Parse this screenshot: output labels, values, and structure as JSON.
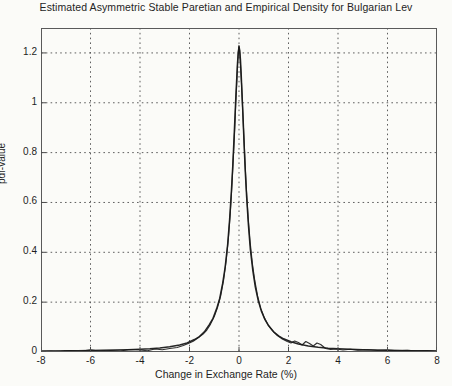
{
  "chart_data": {
    "type": "line",
    "title": "Estimated Asymmetric Stable Paretian and Empirical Density for Bulgarian Lev",
    "xlabel": "Change in Exchange Rate (%)",
    "ylabel": "pdf-value",
    "xlim": [
      -8,
      8
    ],
    "ylim": [
      0,
      1.3
    ],
    "xticks": [
      -8,
      -6,
      -4,
      -2,
      0,
      2,
      4,
      6,
      8
    ],
    "xtick_labels": [
      "-8",
      "-6",
      "-4",
      "-2",
      "0",
      "2",
      "4",
      "6",
      "8"
    ],
    "yticks": [
      0,
      0.2,
      0.4,
      0.6,
      0.8,
      1,
      1.2
    ],
    "ytick_labels": [
      "0",
      "0.2",
      "0.4",
      "0.6",
      "0.8",
      "1",
      "1.2"
    ],
    "grid": true,
    "grid_style": "dotted",
    "legend": null,
    "legend_position": "none",
    "line_color": "#1a1a1a",
    "background_color": "#fbfbf8",
    "axis_color": "#555555",
    "series": [
      {
        "name": "Estimated Asymmetric Stable Paretian Density",
        "style": "solid",
        "x": [
          -8,
          -7.5,
          -7,
          -6.5,
          -6,
          -5.5,
          -5,
          -4.5,
          -4,
          -3.6,
          -3.2,
          -2.8,
          -2.4,
          -2.1,
          -1.8,
          -1.6,
          -1.4,
          -1.2,
          -1.05,
          -0.9,
          -0.78,
          -0.66,
          -0.56,
          -0.46,
          -0.38,
          -0.31,
          -0.25,
          -0.2,
          -0.16,
          -0.12,
          -0.09,
          -0.06,
          -0.03,
          0,
          0.03,
          0.06,
          0.09,
          0.12,
          0.16,
          0.2,
          0.25,
          0.31,
          0.38,
          0.46,
          0.56,
          0.66,
          0.78,
          0.9,
          1.05,
          1.2,
          1.4,
          1.6,
          1.8,
          2.1,
          2.4,
          2.8,
          3.2,
          3.6,
          4,
          4.5,
          5,
          5.5,
          6,
          6.5,
          7,
          7.5,
          8
        ],
        "y": [
          0.004,
          0.004,
          0.005,
          0.005,
          0.006,
          0.007,
          0.008,
          0.009,
          0.011,
          0.013,
          0.016,
          0.021,
          0.028,
          0.036,
          0.05,
          0.062,
          0.081,
          0.11,
          0.135,
          0.175,
          0.215,
          0.275,
          0.34,
          0.43,
          0.53,
          0.64,
          0.75,
          0.86,
          0.95,
          1.04,
          1.1,
          1.16,
          1.2,
          1.225,
          1.21,
          1.17,
          1.11,
          1.04,
          0.95,
          0.85,
          0.73,
          0.62,
          0.51,
          0.41,
          0.325,
          0.26,
          0.205,
          0.165,
          0.13,
          0.105,
          0.081,
          0.065,
          0.053,
          0.041,
          0.032,
          0.024,
          0.019,
          0.015,
          0.013,
          0.011,
          0.009,
          0.008,
          0.007,
          0.006,
          0.005,
          0.005,
          0.004
        ]
      },
      {
        "name": "Empirical Density",
        "style": "solid",
        "x": [
          -8,
          -7.6,
          -7.2,
          -6.8,
          -6.4,
          -6,
          -5.6,
          -5.2,
          -4.8,
          -4.4,
          -4,
          -3.7,
          -3.4,
          -3.1,
          -2.8,
          -2.5,
          -2.25,
          -2.05,
          -1.85,
          -1.65,
          -1.45,
          -1.3,
          -1.15,
          -1,
          -0.87,
          -0.74,
          -0.62,
          -0.52,
          -0.43,
          -0.35,
          -0.28,
          -0.22,
          -0.17,
          -0.13,
          -0.09,
          -0.06,
          -0.03,
          0,
          0.03,
          0.06,
          0.1,
          0.14,
          0.19,
          0.24,
          0.3,
          0.37,
          0.45,
          0.54,
          0.64,
          0.75,
          0.88,
          1.02,
          1.18,
          1.35,
          1.55,
          1.75,
          1.95,
          2.1,
          2.25,
          2.4,
          2.55,
          2.7,
          2.85,
          3.0,
          3.15,
          3.3,
          3.5,
          3.7,
          3.95,
          4.2,
          4.5,
          4.8,
          5.2,
          5.6,
          6.0,
          6.4,
          6.8,
          7.2,
          7.6,
          8
        ],
        "y": [
          0.002,
          0.004,
          0.002,
          0.006,
          0.003,
          0.009,
          0.003,
          0.006,
          0.004,
          0.01,
          0.008,
          0.005,
          0.012,
          0.009,
          0.014,
          0.018,
          0.026,
          0.034,
          0.043,
          0.057,
          0.072,
          0.088,
          0.112,
          0.142,
          0.178,
          0.225,
          0.29,
          0.365,
          0.455,
          0.56,
          0.68,
          0.8,
          0.9,
          1.0,
          1.08,
          1.15,
          1.2,
          1.23,
          1.2,
          1.15,
          1.08,
          0.99,
          0.88,
          0.77,
          0.65,
          0.54,
          0.44,
          0.355,
          0.285,
          0.225,
          0.175,
          0.138,
          0.108,
          0.086,
          0.066,
          0.052,
          0.042,
          0.036,
          0.044,
          0.038,
          0.028,
          0.042,
          0.034,
          0.024,
          0.036,
          0.03,
          0.014,
          0.01,
          0.012,
          0.008,
          0.011,
          0.007,
          0.009,
          0.006,
          0.008,
          0.005,
          0.007,
          0.004,
          0.006,
          0.003
        ]
      }
    ]
  }
}
